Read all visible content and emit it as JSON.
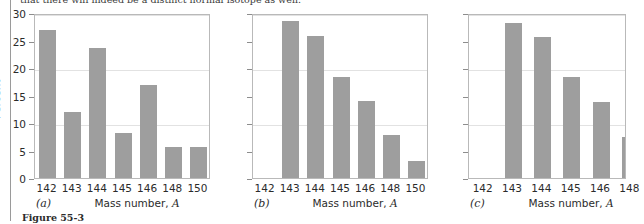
{
  "page": {
    "running_head": "that there will indeed be a distinct normal isotope as well.",
    "figure_caption": "Figure 55-3"
  },
  "chart_data": [
    {
      "type": "bar",
      "panel_label": "(a)",
      "title": "",
      "xlabel": "Mass number, A",
      "ylabel": "Percent",
      "categories": [
        "142",
        "143",
        "144",
        "145",
        "146",
        "148",
        "150"
      ],
      "values": [
        27.2,
        12.2,
        23.9,
        8.3,
        17.1,
        5.7,
        5.7
      ],
      "ylim": [
        0,
        30
      ],
      "yticks": [
        0,
        5,
        10,
        15,
        20,
        25,
        30
      ],
      "ytick_labels": [
        "0",
        "5",
        "10",
        "15",
        "20",
        "25",
        "30"
      ],
      "gridlines": [
        10,
        20,
        30
      ],
      "grid": true,
      "legend": "none",
      "bar_color": "#9e9e9e"
    },
    {
      "type": "bar",
      "panel_label": "(b)",
      "title": "",
      "xlabel": "Mass number, A",
      "ylabel": "",
      "categories": [
        "142",
        "143",
        "144",
        "145",
        "146",
        "148",
        "150"
      ],
      "values": [
        0,
        28.9,
        26.2,
        18.5,
        14.2,
        7.9,
        3.1
      ],
      "ylim": [
        0,
        30
      ],
      "yticks": [
        0,
        5,
        10,
        15,
        20,
        25,
        30
      ],
      "ytick_labels": [
        "",
        "",
        "",
        "",
        "",
        "",
        ""
      ],
      "gridlines": [
        10,
        20,
        30
      ],
      "grid": true,
      "legend": "none",
      "bar_color": "#9e9e9e"
    },
    {
      "type": "bar",
      "panel_label": "(c)",
      "title": "",
      "xlabel": "Mass number, A",
      "ylabel": "",
      "categories": [
        "142",
        "143",
        "144",
        "145",
        "146",
        "148"
      ],
      "values": [
        0,
        28.6,
        26.0,
        18.5,
        14.0,
        7.6
      ],
      "ylim": [
        0,
        30
      ],
      "yticks": [
        0,
        5,
        10,
        15,
        20,
        25,
        30
      ],
      "ytick_labels": [
        "",
        "",
        "",
        "",
        "",
        "",
        ""
      ],
      "gridlines": [
        10,
        20,
        30
      ],
      "grid": true,
      "legend": "none",
      "bar_color": "#9e9e9e",
      "clipped_right": true
    }
  ]
}
